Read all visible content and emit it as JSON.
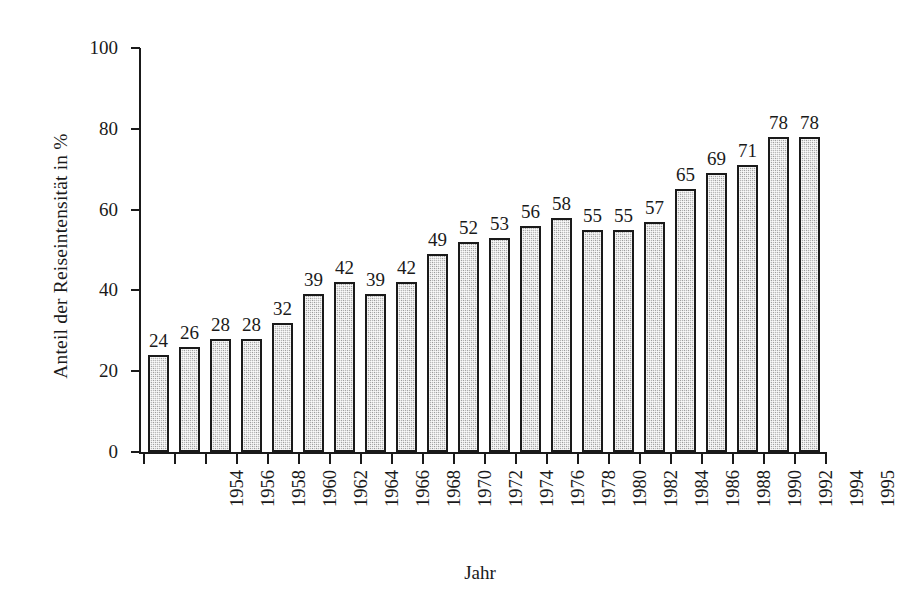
{
  "chart_data": {
    "type": "bar",
    "title": "",
    "subtitle": "",
    "xlabel": "Jahr",
    "ylabel": "Anteil der Reiseintensität in  %",
    "categories": [
      "1954",
      "1956",
      "1958",
      "1960",
      "1962",
      "1964",
      "1966",
      "1968",
      "1970",
      "1972",
      "1974",
      "1976",
      "1978",
      "1980",
      "1982",
      "1984",
      "1986",
      "1988",
      "1990",
      "1992",
      "1994",
      "1995"
    ],
    "values": [
      24,
      26,
      28,
      28,
      32,
      39,
      42,
      39,
      42,
      49,
      52,
      53,
      56,
      58,
      55,
      55,
      57,
      65,
      69,
      71,
      78,
      78
    ],
    "ylim": [
      0,
      100
    ],
    "yticks": [
      0,
      20,
      40,
      60,
      80,
      100
    ],
    "ytick_labels": [
      "0",
      "20",
      "40",
      "60",
      "80",
      "100"
    ],
    "grid": false,
    "legend": null,
    "bar_fill_color": "#b9b9b9",
    "bar_edge_color": "#1a1a1a",
    "background_color": "#ffffff",
    "text_color": "#1a1a1a",
    "value_labels_shown": true,
    "bar_value_labels": [
      "24",
      "26",
      "28",
      "28",
      "32",
      "39",
      "42",
      "39",
      "42",
      "49",
      "52",
      "53",
      "56",
      "58",
      "55",
      "55",
      "57",
      "65",
      "69",
      "71",
      "78",
      "78"
    ]
  }
}
